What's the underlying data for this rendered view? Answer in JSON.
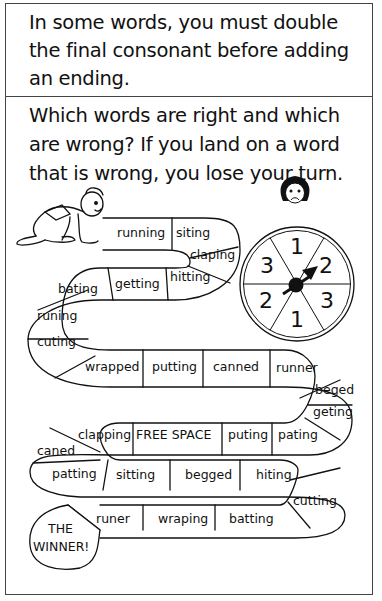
{
  "instructions": {
    "paragraph_1": "In some words, you must double the final consonant before adding an ending.",
    "paragraph_2": "Which words are right and which are wrong? If you land on a word that is wrong, you lose your turn."
  },
  "board": {
    "start_figure": "crouching-runner",
    "spaces": [
      {
        "label": "running"
      },
      {
        "label": "siting"
      },
      {
        "label": "claping"
      },
      {
        "label": "hitting"
      },
      {
        "label": "getting"
      },
      {
        "label": "bating"
      },
      {
        "label": "runing"
      },
      {
        "label": "cuting"
      },
      {
        "label": "wrapped"
      },
      {
        "label": "putting"
      },
      {
        "label": "canned"
      },
      {
        "label": "runner"
      },
      {
        "label": "beged"
      },
      {
        "label": "geting"
      },
      {
        "label": "pating"
      },
      {
        "label": "puting"
      },
      {
        "label": "FREE SPACE"
      },
      {
        "label": "clapping"
      },
      {
        "label": "caned"
      },
      {
        "label": "patting"
      },
      {
        "label": "sitting"
      },
      {
        "label": "begged"
      },
      {
        "label": "hiting"
      },
      {
        "label": "cutting"
      },
      {
        "label": "batting"
      },
      {
        "label": "wraping"
      },
      {
        "label": "runer"
      }
    ],
    "finish": {
      "line_1": "THE",
      "line_2": "WINNER!"
    }
  },
  "spinner": {
    "sections": [
      "1",
      "2",
      "3",
      "1",
      "2",
      "3"
    ],
    "pointer_direction": "toward-2"
  },
  "colors": {
    "ink": "#111111",
    "frame": "#444444",
    "background": "#ffffff"
  }
}
